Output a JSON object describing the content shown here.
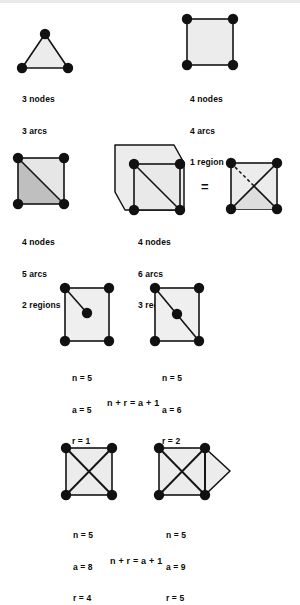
{
  "page": {
    "background_color": "#ffffff",
    "ink_color": "#141414",
    "fill_light": "#eeeeee",
    "fill_mid": "#e3e3e3",
    "fill_dark": "#bdbdbd"
  },
  "figures": [
    {
      "id": "triangle",
      "shape": "triangle",
      "caption": [
        "3 nodes",
        "3 arcs",
        "1 region"
      ],
      "nodes": 3,
      "arcs": 3,
      "regions": 1
    },
    {
      "id": "square",
      "shape": "square",
      "caption": [
        "4 nodes",
        "4 arcs",
        "1 region"
      ],
      "nodes": 4,
      "arcs": 4,
      "regions": 1
    },
    {
      "id": "square-diagonal",
      "shape": "square with one diagonal",
      "caption": [
        "4 nodes",
        "5 arcs",
        "2 regions"
      ],
      "nodes": 4,
      "arcs": 5,
      "regions": 2
    },
    {
      "id": "cube-projection",
      "shape": "square with diagonal inside outer polygon",
      "caption": [
        "4 nodes",
        "6 arcs",
        "3 regions"
      ],
      "nodes": 4,
      "arcs": 6,
      "regions": 3
    },
    {
      "id": "square-both-diagonals-dashed",
      "shape": "square with two crossing diagonals, one partly dashed",
      "caption": [],
      "nodes": 4,
      "arcs": 6,
      "regions": 3
    }
  ],
  "equals_sign": "=",
  "row3": {
    "left": {
      "id": "square-spur-node",
      "caption": [
        "n = 5",
        "a = 5",
        "r = 1"
      ],
      "n": 5,
      "a": 5,
      "r": 1
    },
    "right": {
      "id": "square-diagonal-midnode",
      "caption": [
        "n = 5",
        "a = 6",
        "r = 2"
      ],
      "n": 5,
      "a": 6,
      "r": 2
    },
    "formula": "n + r = a + 1"
  },
  "row4": {
    "left": {
      "id": "square-x-crossing",
      "caption": [
        "n = 5",
        "a = 8",
        "r = 4"
      ],
      "n": 5,
      "a": 8,
      "r": 4
    },
    "right": {
      "id": "square-x-plus-triangle",
      "caption": [
        "n = 5",
        "a = 9",
        "r = 5"
      ],
      "n": 5,
      "a": 9,
      "r": 5
    },
    "formula": "n + r = a + 1"
  },
  "labels": {
    "fig1_l1": "3 nodes",
    "fig1_l2": "3 arcs",
    "fig1_l3": "1 region",
    "fig2_l1": "4 nodes",
    "fig2_l2": "4 arcs",
    "fig2_l3": "1 region",
    "fig3_l1": "4 nodes",
    "fig3_l2": "5 arcs",
    "fig3_l3": "2 regions",
    "fig4_l1": "4 nodes",
    "fig4_l2": "6 arcs",
    "fig4_l3": "3 regions",
    "fig5_l1": "n = 5",
    "fig5_l2": "a = 5",
    "fig5_l3": "r = 1",
    "fig6_l1": "n = 5",
    "fig6_l2": "a = 6",
    "fig6_l3": "r = 2",
    "fig7_l1": "n = 5",
    "fig7_l2": "a = 8",
    "fig7_l3": "r = 4",
    "fig8_l1": "n = 5",
    "fig8_l2": "a = 9",
    "fig8_l3": "r = 5",
    "formula1": "n + r = a + 1",
    "formula2": "n + r = a + 1",
    "equals": "="
  }
}
